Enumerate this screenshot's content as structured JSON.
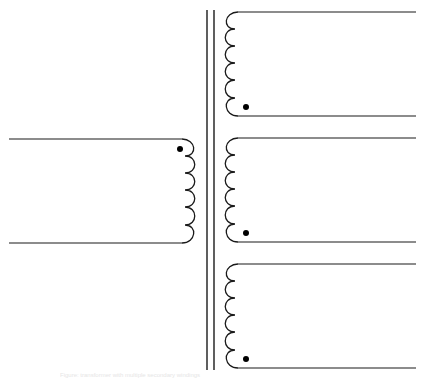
{
  "diagram": {
    "colors": {
      "line": "#1a1a1a",
      "dot": "#000000",
      "background": "#ffffff"
    },
    "core": {
      "lines": 2,
      "x": [
        207,
        214
      ],
      "y_top": 10,
      "y_bottom": 370
    },
    "primary": {
      "side": "left",
      "turns": 6,
      "top_lead_y": 139,
      "bottom_lead_y": 243,
      "lead_x_start": 9,
      "coil_x": 190,
      "polarity_dot": "top"
    },
    "secondaries": [
      {
        "id": "secondary-1",
        "turns": 6,
        "top_lead_y": 12,
        "bottom_lead_y": 116,
        "coil_x": 230,
        "lead_x_end": 416,
        "polarity_dot": "bottom"
      },
      {
        "id": "secondary-2",
        "turns": 6,
        "top_lead_y": 138,
        "bottom_lead_y": 242,
        "coil_x": 230,
        "lead_x_end": 416,
        "polarity_dot": "bottom"
      },
      {
        "id": "secondary-3",
        "turns": 6,
        "top_lead_y": 264,
        "bottom_lead_y": 368,
        "coil_x": 230,
        "lead_x_end": 416,
        "polarity_dot": "bottom"
      }
    ]
  },
  "caption": "Figure: transformer with multiple secondary windings"
}
